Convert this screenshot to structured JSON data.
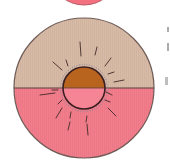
{
  "diagram": {
    "type": "cross-section illustration",
    "top_partial_circle": {
      "cx": 84,
      "cy": -28,
      "r": 33,
      "fill": "#f2707f",
      "stroke": "#b85a66"
    },
    "outer_circle": {
      "cx": 84,
      "cy": 88,
      "r": 70,
      "stroke": "#6f5a55"
    },
    "upper_half": {
      "fill": "#d8bba6",
      "label": ""
    },
    "lower_half": {
      "fill": "#f47d8c",
      "label": ""
    },
    "divider": {
      "y": 88,
      "stroke": "#5a3e3e"
    },
    "inner_circle": {
      "cx": 84,
      "cy": 88,
      "r": 21,
      "upper_fill": "#b8641f",
      "lower_fill": "#f58595",
      "stroke": "#3a1e22"
    },
    "colors": {
      "background": "#ffffff",
      "radiating_lines": "#3f2a28",
      "halo": "#8c8a9a"
    }
  }
}
